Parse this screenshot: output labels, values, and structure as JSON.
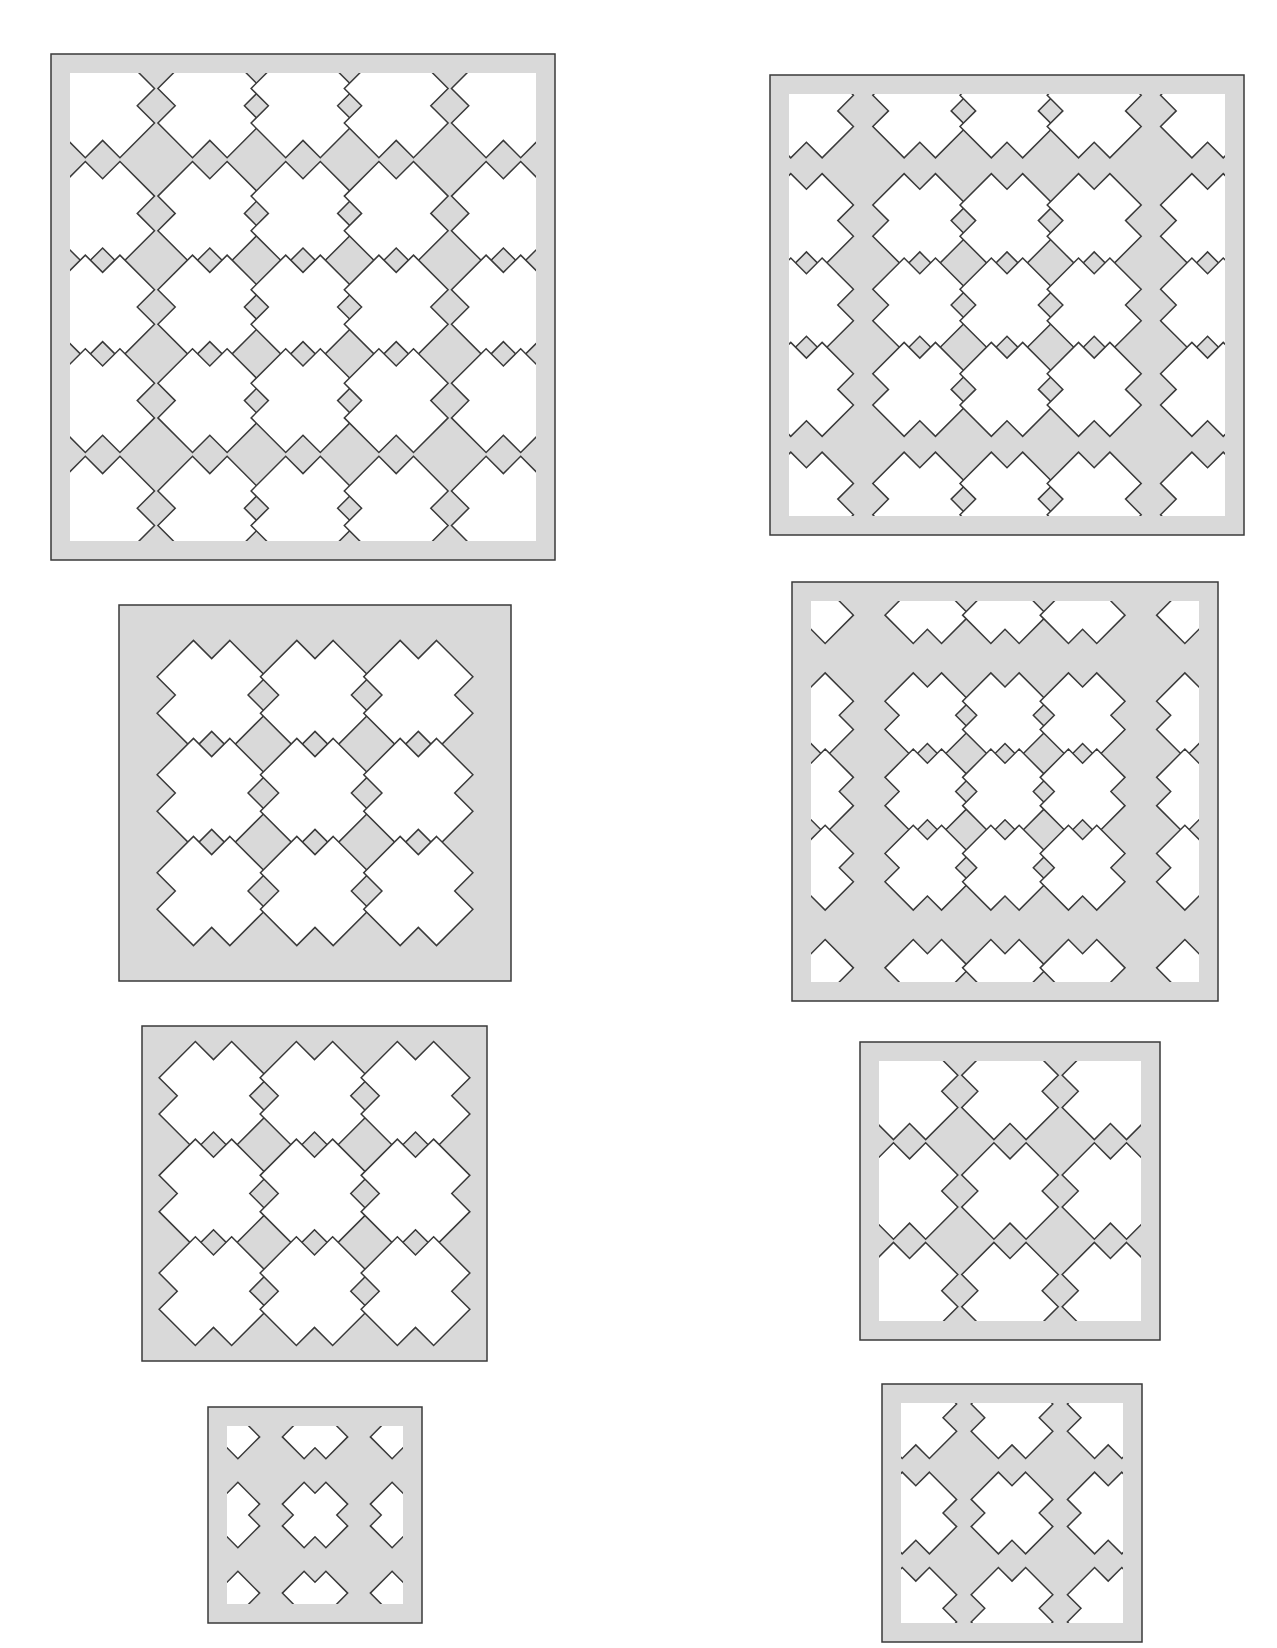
{
  "figure": {
    "title": "",
    "colors": {
      "plate": "#d9d9d9",
      "hole": "#ffffff",
      "stroke": "#3a3a3a"
    },
    "panels": [
      {
        "id": "panel-a",
        "x": 50,
        "y": 53,
        "w": 506,
        "h": 508,
        "grid": 5,
        "edge": "cut",
        "pad": 20
      },
      {
        "id": "panel-b",
        "x": 769,
        "y": 74,
        "w": 476,
        "h": 462,
        "grid": 5,
        "edge": "chamfer",
        "pad": 20
      },
      {
        "id": "panel-c",
        "x": 118,
        "y": 604,
        "w": 394,
        "h": 378,
        "grid": 3,
        "edge": "full",
        "pad": 42
      },
      {
        "id": "panel-d",
        "x": 791,
        "y": 581,
        "w": 428,
        "h": 421,
        "grid": 5,
        "edge": "triangle",
        "pad": 20
      },
      {
        "id": "panel-e",
        "x": 141,
        "y": 1025,
        "w": 347,
        "h": 337,
        "grid": 3,
        "edge": "full",
        "pad": 22
      },
      {
        "id": "panel-f",
        "x": 859,
        "y": 1041,
        "w": 302,
        "h": 300,
        "grid": 3,
        "edge": "cut",
        "pad": 20
      },
      {
        "id": "panel-g",
        "x": 207,
        "y": 1406,
        "w": 216,
        "h": 218,
        "grid": 3,
        "edge": "triangle",
        "pad": 20
      },
      {
        "id": "panel-h",
        "x": 881,
        "y": 1383,
        "w": 262,
        "h": 260,
        "grid": 3,
        "edge": "chamfer",
        "pad": 20
      }
    ]
  }
}
